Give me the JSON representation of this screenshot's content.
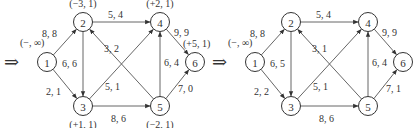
{
  "graphs": [
    {
      "id": "left",
      "entry_arrow": "⇒",
      "nodes": [
        {
          "id": "1",
          "label": "1",
          "mark": "(−, ∞)"
        },
        {
          "id": "2",
          "label": "2",
          "mark": "(−3, 1)"
        },
        {
          "id": "3",
          "label": "3",
          "mark": "(+1, 1)"
        },
        {
          "id": "4",
          "label": "4",
          "mark": "(+2, 1)"
        },
        {
          "id": "5",
          "label": "5",
          "mark": "(−2, 1)"
        },
        {
          "id": "6",
          "label": "6",
          "mark": "(+5, 1)"
        }
      ],
      "edges": [
        {
          "from": "1",
          "to": "2",
          "label": "8, 8"
        },
        {
          "from": "1",
          "to": "3",
          "label": "2, 1"
        },
        {
          "from": "2",
          "to": "3",
          "label": "6, 6"
        },
        {
          "from": "2",
          "to": "4",
          "label": "5, 4"
        },
        {
          "from": "5",
          "to": "2",
          "label": "3, 2"
        },
        {
          "from": "3",
          "to": "4",
          "label": "5, 1"
        },
        {
          "from": "3",
          "to": "5",
          "label": "8, 6"
        },
        {
          "from": "5",
          "to": "4",
          "label": "6, 4"
        },
        {
          "from": "4",
          "to": "6",
          "label": "9, 9"
        },
        {
          "from": "5",
          "to": "6",
          "label": "7, 0"
        }
      ]
    },
    {
      "id": "right",
      "entry_arrow": "⇒",
      "nodes": [
        {
          "id": "1",
          "label": "1",
          "mark": "(−, ∞)"
        },
        {
          "id": "2",
          "label": "2",
          "mark": ""
        },
        {
          "id": "3",
          "label": "3",
          "mark": ""
        },
        {
          "id": "4",
          "label": "4",
          "mark": ""
        },
        {
          "id": "5",
          "label": "5",
          "mark": ""
        },
        {
          "id": "6",
          "label": "6",
          "mark": ""
        }
      ],
      "edges": [
        {
          "from": "1",
          "to": "2",
          "label": "8, 8"
        },
        {
          "from": "1",
          "to": "3",
          "label": "2, 2"
        },
        {
          "from": "2",
          "to": "3",
          "label": "6, 5"
        },
        {
          "from": "2",
          "to": "4",
          "label": "5, 4"
        },
        {
          "from": "5",
          "to": "2",
          "label": "3, 1"
        },
        {
          "from": "3",
          "to": "4",
          "label": "5, 1"
        },
        {
          "from": "3",
          "to": "5",
          "label": "8, 6"
        },
        {
          "from": "5",
          "to": "4",
          "label": "6, 4"
        },
        {
          "from": "4",
          "to": "6",
          "label": "9, 9"
        },
        {
          "from": "5",
          "to": "6",
          "label": "7, 1"
        }
      ]
    }
  ]
}
